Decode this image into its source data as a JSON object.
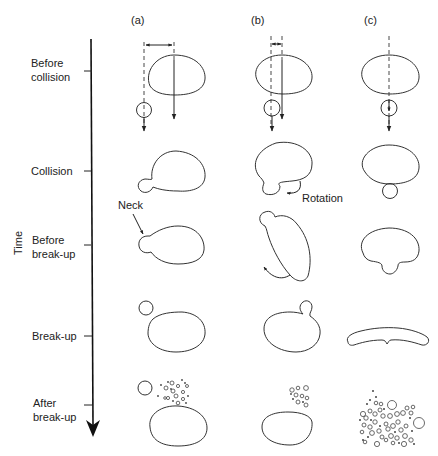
{
  "columns": [
    {
      "id": "a",
      "label": "(a)"
    },
    {
      "id": "b",
      "label": "(b)"
    },
    {
      "id": "c",
      "label": "(c)"
    }
  ],
  "time_axis": {
    "label": "Time",
    "stages": [
      {
        "id": "before-collision",
        "line1": "Before",
        "line2": "collision"
      },
      {
        "id": "collision",
        "line1": "Collision",
        "line2": ""
      },
      {
        "id": "before-breakup",
        "line1": "Before",
        "line2": "break-up"
      },
      {
        "id": "breakup",
        "line1": "Break-up",
        "line2": ""
      },
      {
        "id": "after-breakup",
        "line1": "After",
        "line2": "break-up"
      }
    ]
  },
  "annotations": {
    "neck": "Neck",
    "rotation": "Rotation"
  },
  "colors": {
    "stroke": "#333333",
    "background": "#ffffff"
  }
}
